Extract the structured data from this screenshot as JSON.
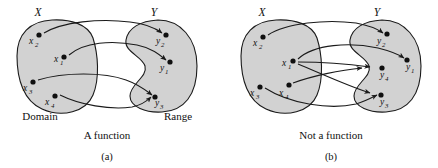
{
  "figure": {
    "background_color": "#ffffff",
    "blob_fill_color": "#d2d2d2",
    "stroke_color": "#1a1a1a"
  },
  "panels": [
    {
      "id": "(a)",
      "caption": "A function",
      "domain": {
        "set_label": "X",
        "edge_label": "Domain",
        "points": [
          {
            "name": "x2",
            "base": "x",
            "sub": "2",
            "cx": 39,
            "cy": 35
          },
          {
            "name": "x1",
            "base": "x",
            "sub": "1",
            "cx": 64,
            "cy": 57
          },
          {
            "name": "x3",
            "base": "x",
            "sub": "3",
            "cx": 33,
            "cy": 82
          },
          {
            "name": "x4",
            "base": "x",
            "sub": "4",
            "cx": 55,
            "cy": 96
          }
        ]
      },
      "range": {
        "set_label": "Y",
        "edge_label": "Range",
        "points": [
          {
            "name": "y2",
            "base": "y",
            "sub": "2",
            "cx": 166,
            "cy": 35
          },
          {
            "name": "y1",
            "base": "y",
            "sub": "1",
            "cx": 170,
            "cy": 62
          },
          {
            "name": "y3",
            "base": "y",
            "sub": "3",
            "cx": 155,
            "cy": 97
          }
        ]
      },
      "mappings": [
        {
          "from": "x2",
          "to": "y2"
        },
        {
          "from": "x1",
          "to": "y1"
        },
        {
          "from": "x3",
          "to": "y3"
        },
        {
          "from": "x4",
          "to": "y3"
        }
      ]
    },
    {
      "id": "(b)",
      "caption": "Not a function",
      "domain": {
        "set_label": "X",
        "edge_label": "",
        "points": [
          {
            "name": "x2",
            "base": "x",
            "sub": "2",
            "cx": 263,
            "cy": 37
          },
          {
            "name": "x1",
            "base": "x",
            "sub": "1",
            "cx": 293,
            "cy": 61
          },
          {
            "name": "x3",
            "base": "x",
            "sub": "3",
            "cx": 260,
            "cy": 87
          },
          {
            "name": "x4",
            "base": "x",
            "sub": "4",
            "cx": 289,
            "cy": 85
          }
        ]
      },
      "range": {
        "set_label": "Y",
        "edge_label": "",
        "points": [
          {
            "name": "y2",
            "base": "y",
            "sub": "2",
            "cx": 387,
            "cy": 34
          },
          {
            "name": "y1",
            "base": "y",
            "sub": "1",
            "cx": 407,
            "cy": 60
          },
          {
            "name": "y4",
            "base": "y",
            "sub": "4",
            "cx": 382,
            "cy": 68
          },
          {
            "name": "y3",
            "base": "y",
            "sub": "3",
            "cx": 381,
            "cy": 95
          }
        ]
      },
      "mappings": [
        {
          "from": "x2",
          "to": "y2"
        },
        {
          "from": "x1",
          "to": "y1"
        },
        {
          "from": "x1",
          "to": "y4"
        },
        {
          "from": "x1",
          "to": "y3"
        },
        {
          "from": "x4",
          "to": "y3"
        },
        {
          "from": "x3",
          "to": "y3"
        }
      ]
    }
  ]
}
